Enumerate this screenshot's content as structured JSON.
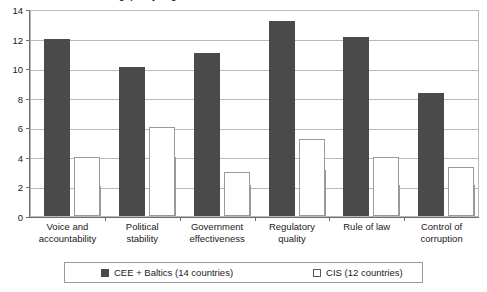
{
  "chart_data": {
    "type": "bar",
    "title": "Chart 3. Indicators showing quality of governance",
    "xlabel": "",
    "ylabel": "",
    "ylim": [
      0,
      14
    ],
    "yticks": [
      0,
      2,
      4,
      6,
      8,
      10,
      12,
      14
    ],
    "grid": true,
    "legend_position": "bottom",
    "categories": [
      "Voice and accountability",
      "Political stability",
      "Government effectiveness",
      "Regulatory quality",
      "Rule of law",
      "Control of corruption"
    ],
    "category_lines": [
      [
        "Voice and",
        "accountability"
      ],
      [
        "Political",
        "stability"
      ],
      [
        "Government",
        "effectiveness"
      ],
      [
        "Regulatory",
        "quality"
      ],
      [
        "Rule of law",
        ""
      ],
      [
        "Control of",
        "corruption"
      ]
    ],
    "series": [
      {
        "name": "CEE + Baltics (14 countries)",
        "color": "#4a4a4a",
        "values": [
          12.0,
          10.1,
          11.0,
          13.2,
          12.1,
          8.3
        ]
      },
      {
        "name": "CIS (12 countries)",
        "color": "#ffffff",
        "values": [
          4.0,
          6.0,
          3.0,
          5.2,
          4.0,
          3.3
        ]
      }
    ],
    "series_secondary": {
      "name": "inner-step",
      "values": [
        2.0,
        4.0,
        2.1,
        3.1,
        2.1,
        2.1
      ]
    }
  },
  "legend": {
    "entries": [
      {
        "label": "CEE + Baltics (14 countries)",
        "swatch": "dark"
      },
      {
        "label": "CIS (12 countries)",
        "swatch": "light"
      }
    ]
  },
  "axis": {
    "y_tick_labels": [
      "0",
      "2",
      "4",
      "6",
      "8",
      "10",
      "12",
      "14"
    ]
  }
}
